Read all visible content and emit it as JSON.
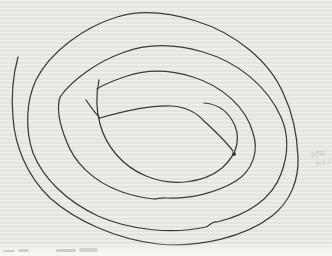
{
  "paper": {
    "base_color": "#eae8e4",
    "bottom_edge_color": "#f6f5f2"
  },
  "drawing": {
    "description": "freehand-spiral-scribble",
    "ink_color": "#3e3a36",
    "stroke_width": 1.25,
    "strokes": [
      {
        "name": "outer-spiral",
        "d": "M 18 57 C 13 75, 11 95, 13 118 C 15 146, 27 176, 50 198 C 76 221, 116 239, 158 244 C 199 248, 245 237, 272 216 C 291 201, 299 179, 298 157 C 297 134, 293 114, 284 95 C 270 61, 235 33, 196 21 C 164 11, 139 10, 117 17 C 84 27, 50 52, 36 80 C 26 101, 25 130, 33 153 C 43 178, 66 201, 98 216 C 132 231, 174 234, 206 227 C 210 225, 212 221, 217 222 C 247 215, 272 199, 281 174 C 289 153, 288 133, 281 117 C 267 86, 238 62, 203 52 C 172 43, 145 44, 122 53 C 97 62, 72 80, 60 97 C 56 110, 60 125, 66 140 C 74 163, 94 182, 122 192 C 134 196, 143 198, 154 199 C 158 199, 162 197, 167 198 C 190 199, 216 193, 236 181 C 253 170, 259 151, 253 133 C 246 107, 222 86, 193 77 C 168 69, 145 70, 127 76 C 115 80, 104 84, 97 89"
      },
      {
        "name": "inner-curve-to-dot",
        "d": "M 86 100 C 90 106, 94 112, 100 118 C 124 111, 152 105, 172 106 C 186 107, 196 112, 204 121 C 216 132, 227 143, 233 151"
      },
      {
        "name": "center-loop",
        "d": "M 99 80 C 96 95, 96 110, 100 124 C 106 146, 122 166, 146 176 C 172 187, 204 183, 222 168 C 238 154, 242 136, 232 120 C 226 110, 216 104, 204 103"
      }
    ],
    "end_dot": {
      "cx": 234,
      "cy": 154,
      "r": 2
    }
  },
  "margin_note": {
    "line1": "206",
    "line2": "9/17",
    "color": "#b2aa9e"
  },
  "caption_smudges": [
    {
      "x": 3,
      "y": 250,
      "w": 12,
      "h": 2,
      "color": "#cfccc8"
    },
    {
      "x": 18,
      "y": 249,
      "w": 11,
      "h": 2.5,
      "color": "#d3d0cc"
    },
    {
      "x": 56,
      "y": 249,
      "w": 20,
      "h": 3,
      "color": "#d0cdc9"
    },
    {
      "x": 79,
      "y": 248,
      "w": 19,
      "h": 3.5,
      "color": "#d4d1cd"
    }
  ]
}
